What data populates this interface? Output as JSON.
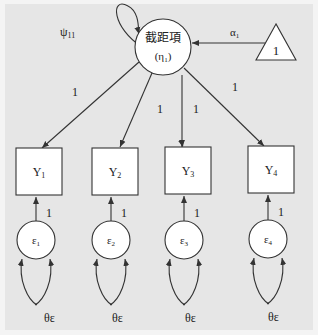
{
  "diagram": {
    "type": "latent growth model (intercept only)",
    "latent": {
      "label": "截距項",
      "symbol": "η",
      "subscript": "1"
    },
    "latent_variance": {
      "symbol": "ψ",
      "subscript": "11"
    },
    "constant": {
      "label": "1",
      "path": {
        "symbol": "α",
        "subscript": "1"
      }
    },
    "observed": [
      {
        "symbol": "Y",
        "subscript": "1",
        "loading": "1"
      },
      {
        "symbol": "Y",
        "subscript": "2",
        "loading": "1"
      },
      {
        "symbol": "Y",
        "subscript": "3",
        "loading": "1"
      },
      {
        "symbol": "Y",
        "subscript": "4",
        "loading": "1"
      }
    ],
    "errors": [
      {
        "symbol": "ε",
        "subscript": "1",
        "path": "1",
        "variance": "θε"
      },
      {
        "symbol": "ε",
        "subscript": "2",
        "path": "1",
        "variance": "θε"
      },
      {
        "symbol": "ε",
        "subscript": "3",
        "path": "1",
        "variance": "θε"
      },
      {
        "symbol": "ε",
        "subscript": "4",
        "path": "1",
        "variance": "θε"
      }
    ]
  }
}
